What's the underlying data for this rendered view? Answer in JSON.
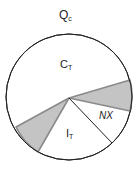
{
  "diagram": {
    "title": {
      "base": "Q",
      "sub": "c"
    },
    "segments": [
      {
        "id": "ct",
        "label_base": "C",
        "label_sub": "T",
        "fill": "#ffffff"
      },
      {
        "id": "shaded-right",
        "label_base": "",
        "label_sub": "",
        "fill": "#c4c4c4"
      },
      {
        "id": "nx",
        "label_base": "NX",
        "label_sub": "",
        "fill": "#ffffff"
      },
      {
        "id": "it",
        "label_base": "I",
        "label_sub": "T",
        "fill": "#ffffff"
      },
      {
        "id": "shaded-left",
        "label_base": "",
        "label_sub": "",
        "fill": "#c4c4c4"
      }
    ],
    "colors": {
      "outline": "#222222",
      "shade": "#c4c4c4",
      "shade_edge": "#8a8a8a",
      "background": "#ffffff"
    }
  }
}
